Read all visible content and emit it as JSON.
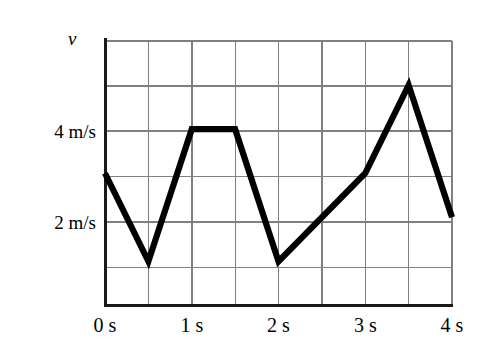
{
  "chart_data": {
    "type": "line",
    "title": "",
    "xlabel": "",
    "ylabel": "v",
    "x": [
      0,
      0.5,
      1,
      1.5,
      2,
      3,
      3.5,
      4
    ],
    "values": [
      3,
      1,
      4,
      4,
      1,
      3,
      5,
      2
    ],
    "series": [
      {
        "name": "v",
        "x": [
          0,
          0.5,
          1,
          1.5,
          2,
          3,
          3.5,
          4
        ],
        "values": [
          3,
          1,
          4,
          4,
          1,
          3,
          5,
          2
        ]
      }
    ],
    "xlim": [
      0,
      4
    ],
    "ylim": [
      0,
      6
    ],
    "grid": true,
    "grid_x_step": 0.5,
    "grid_y_step": 1,
    "legend_position": "none",
    "x_tick_labels": [
      "0 s",
      "1 s",
      "2 s",
      "3 s",
      "4 s"
    ],
    "x_tick_values": [
      0,
      1,
      2,
      3,
      4
    ],
    "y_tick_labels": [
      "4 m/s",
      "2 m/s"
    ],
    "y_tick_values": [
      4,
      2
    ],
    "line_color": "#000000",
    "grid_color": "#808080",
    "axis_color": "#000000",
    "background_color": "#ffffff"
  },
  "axis": {
    "y_axis_symbol": "v"
  },
  "ticks": {
    "y": [
      {
        "label": "4 m/s",
        "value": 4
      },
      {
        "label": "2 m/s",
        "value": 2
      }
    ],
    "x": [
      {
        "label": "0 s",
        "value": 0
      },
      {
        "label": "1 s",
        "value": 1
      },
      {
        "label": "2 s",
        "value": 2
      },
      {
        "label": "3 s",
        "value": 3
      },
      {
        "label": "4 s",
        "value": 4
      }
    ]
  }
}
